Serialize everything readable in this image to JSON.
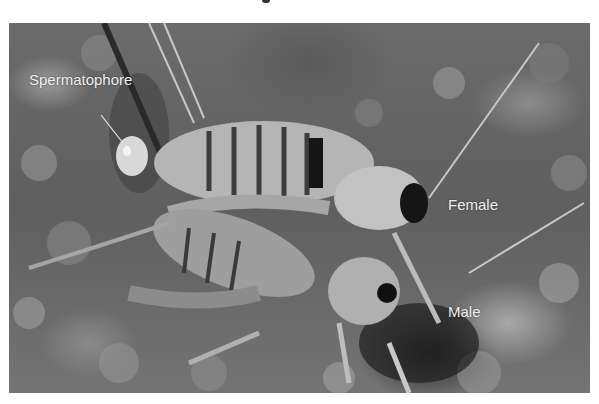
{
  "figure": {
    "labels": {
      "spermatophore": "Spermatophore",
      "female": "Female",
      "male": "Male"
    },
    "colors": {
      "label_text": "#f2f2f2",
      "background": "#ffffff"
    }
  }
}
